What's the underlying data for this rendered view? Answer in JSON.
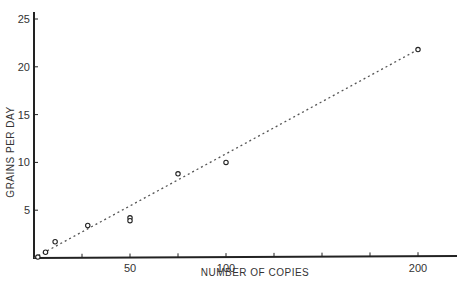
{
  "chart_data": {
    "type": "scatter",
    "title": "",
    "xlabel": "NUMBER OF COPIES",
    "ylabel": "GRAINS PER DAY",
    "xlim": [
      0,
      225
    ],
    "ylim": [
      0,
      26
    ],
    "grid": false,
    "legend": null,
    "x_ticks": [
      0,
      25,
      50,
      75,
      100,
      125,
      150,
      175,
      200
    ],
    "x_tick_labels": [
      {
        "value": 50,
        "label": "50"
      },
      {
        "value": 100,
        "label": "100"
      },
      {
        "value": 200,
        "label": "200"
      }
    ],
    "y_ticks": [
      5,
      10,
      15,
      20,
      25
    ],
    "y_tick_labels": [
      {
        "value": 5,
        "label": "5"
      },
      {
        "value": 10,
        "label": "10"
      },
      {
        "value": 15,
        "label": "15"
      },
      {
        "value": 20,
        "label": "20"
      },
      {
        "value": 25,
        "label": "25"
      }
    ],
    "series": [
      {
        "name": "observed",
        "marker": "open-circle",
        "points": [
          {
            "x": 2,
            "y": 0.1
          },
          {
            "x": 6,
            "y": 0.6
          },
          {
            "x": 11,
            "y": 1.7
          },
          {
            "x": 28,
            "y": 3.4
          },
          {
            "x": 50,
            "y": 4.2
          },
          {
            "x": 50,
            "y": 3.9
          },
          {
            "x": 75,
            "y": 8.8
          },
          {
            "x": 100,
            "y": 10.0
          },
          {
            "x": 200,
            "y": 21.8
          }
        ]
      },
      {
        "name": "fit",
        "style": "dotted-line",
        "points": [
          {
            "x": 0,
            "y": 0
          },
          {
            "x": 200,
            "y": 21.8
          }
        ]
      }
    ]
  }
}
